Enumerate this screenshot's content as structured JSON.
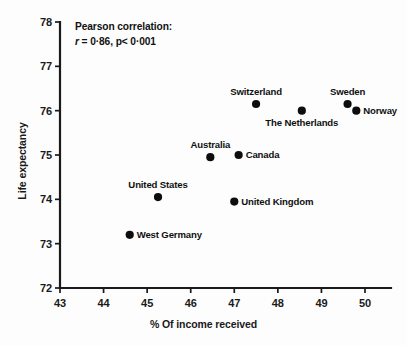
{
  "chart_data": {
    "type": "scatter",
    "title": "",
    "xlabel": "% Of income received",
    "ylabel": "Life expectancy",
    "xlim": [
      43,
      50.4
    ],
    "ylim": [
      72,
      78
    ],
    "xticks": [
      43,
      44,
      45,
      46,
      47,
      48,
      49,
      50
    ],
    "yticks": [
      72,
      73,
      74,
      75,
      76,
      77,
      78
    ],
    "grid": false,
    "legend": "none",
    "points": [
      {
        "label": "West Germany",
        "x": 44.6,
        "y": 73.2,
        "label_pos": "right"
      },
      {
        "label": "United States",
        "x": 45.25,
        "y": 74.05,
        "label_pos": "above"
      },
      {
        "label": "Australia",
        "x": 46.45,
        "y": 74.95,
        "label_pos": "above"
      },
      {
        "label": "United Kingdom",
        "x": 47.0,
        "y": 73.95,
        "label_pos": "right"
      },
      {
        "label": "Canada",
        "x": 47.1,
        "y": 75.0,
        "label_pos": "right"
      },
      {
        "label": "Switzerland",
        "x": 47.5,
        "y": 76.15,
        "label_pos": "above"
      },
      {
        "label": "The Netherlands",
        "x": 48.55,
        "y": 76.0,
        "label_pos": "below"
      },
      {
        "label": "Sweden",
        "x": 49.6,
        "y": 76.15,
        "label_pos": "above"
      },
      {
        "label": "Norway",
        "x": 49.8,
        "y": 76.0,
        "label_pos": "right"
      }
    ],
    "annotation": {
      "heading": "Pearson correlation:",
      "r_symbol": "r",
      "r_value": "= 0·86, p< 0·001"
    },
    "colors": {
      "point": "#0d0d0d",
      "axis": "#1a1a1a",
      "background": "#fdfdfd"
    }
  }
}
